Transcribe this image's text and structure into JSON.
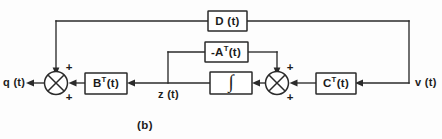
{
  "figure": {
    "caption": "(b)",
    "background_color": "#fdfdfd",
    "line_color": "#2a2a2a"
  },
  "blocks": [
    {
      "id": "D",
      "label_main": "D (t)",
      "label_sup": "",
      "label_pre": ""
    },
    {
      "id": "A",
      "label_main": "A",
      "label_sup": "T",
      "label_pre": "-",
      "label_post": "(t)"
    },
    {
      "id": "B",
      "label_main": "B",
      "label_sup": "T",
      "label_pre": "",
      "label_post": "(t)"
    },
    {
      "id": "C",
      "label_main": "C",
      "label_sup": "T",
      "label_pre": "",
      "label_post": "(t)"
    },
    {
      "id": "integrator",
      "label_main": "∫",
      "label_sup": "",
      "label_pre": ""
    }
  ],
  "signals": {
    "output_label": "q (t)",
    "input_label": "v (t)",
    "state_label": "z (t)"
  },
  "junctions": [
    {
      "id": "left-sum",
      "sign_top": "+",
      "sign_bottom": "+"
    },
    {
      "id": "right-sum",
      "sign_top": "+",
      "sign_bottom": "+"
    }
  ]
}
